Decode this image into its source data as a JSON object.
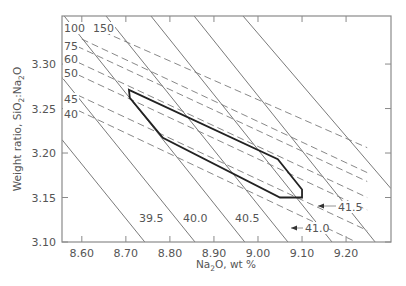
{
  "chart_data": {
    "type": "line",
    "title": "",
    "xlabel": "Na2O, wt %",
    "ylabel": "Weight ratio, SiO2:Na2O",
    "xlim": [
      8.555,
      9.302
    ],
    "ylim": [
      3.1,
      3.354
    ],
    "x_ticks": [
      "8.60",
      "8.70",
      "8.80",
      "8.90",
      "9.00",
      "9.10",
      "9.20"
    ],
    "y_ticks": [
      "3.10",
      "3.15",
      "3.20",
      "3.25",
      "3.30"
    ],
    "grid": false,
    "solid_isolines": [
      {
        "label": "39.5",
        "points": [
          [
            8.555,
            3.215
          ],
          [
            8.743,
            3.1
          ]
        ]
      },
      {
        "label": "40.0",
        "points": [
          [
            8.555,
            3.285
          ],
          [
            8.857,
            3.1
          ]
        ]
      },
      {
        "label": "40.5",
        "points": [
          [
            8.56,
            3.354
          ],
          [
            8.97,
            3.1
          ]
        ]
      },
      {
        "label": "41.0",
        "points": [
          [
            8.655,
            3.354
          ],
          [
            9.068,
            3.1
          ]
        ]
      },
      {
        "label": "41.5",
        "points": [
          [
            8.757,
            3.354
          ],
          [
            9.168,
            3.1
          ]
        ]
      },
      {
        "label": "",
        "points": [
          [
            8.855,
            3.354
          ],
          [
            9.266,
            3.1
          ]
        ]
      },
      {
        "label": "",
        "points": [
          [
            8.966,
            3.354
          ],
          [
            9.302,
            3.16
          ]
        ]
      }
    ],
    "dashed_isolines": [
      {
        "label": "150",
        "points": [
          [
            8.627,
            3.341
          ],
          [
            9.248,
            3.206
          ]
        ]
      },
      {
        "label": "100",
        "points": [
          [
            8.6,
            3.328
          ],
          [
            9.248,
            3.178
          ]
        ]
      },
      {
        "label": "75",
        "points": [
          [
            8.589,
            3.32
          ],
          [
            9.248,
            3.168
          ]
        ]
      },
      {
        "label": "60",
        "points": [
          [
            8.591,
            3.302
          ],
          [
            9.248,
            3.15
          ]
        ]
      },
      {
        "label": "50",
        "points": [
          [
            8.591,
            3.288
          ],
          [
            9.248,
            3.136
          ]
        ]
      },
      {
        "label": "45",
        "points": [
          [
            8.591,
            3.265
          ],
          [
            9.248,
            3.113
          ]
        ]
      },
      {
        "label": "40",
        "points": [
          [
            8.591,
            3.248
          ],
          [
            9.223,
            3.1
          ]
        ]
      }
    ],
    "region_polygon": [
      [
        8.707,
        3.271
      ],
      [
        9.045,
        3.193
      ],
      [
        9.1,
        3.159
      ],
      [
        9.1,
        3.15
      ],
      [
        9.05,
        3.15
      ],
      [
        8.784,
        3.217
      ],
      [
        8.709,
        3.262
      ]
    ]
  },
  "axes": {
    "x_title_main": "Na",
    "x_title_sub": "2",
    "x_title_rest": "O, wt %",
    "y_title_main": "Weight ratio, SiO",
    "y_title_sub1": "2",
    "y_title_mid": ":Na",
    "y_title_sub2": "2",
    "y_title_rest": "O"
  },
  "labels": {
    "solid": [
      {
        "text": "39.5",
        "x": 139,
        "y": 222
      },
      {
        "text": "40.0",
        "x": 183,
        "y": 222
      },
      {
        "text": "40.5",
        "x": 235,
        "y": 222
      },
      {
        "text": "41.0",
        "x": 305,
        "y": 232,
        "arrow_to": [
          291,
          228
        ]
      },
      {
        "text": "41.5",
        "x": 338,
        "y": 211,
        "arrow_to": [
          318,
          206
        ]
      }
    ],
    "dashed": [
      {
        "text": "100",
        "x": 64,
        "y": 32
      },
      {
        "text": "150",
        "x": 93,
        "y": 32
      },
      {
        "text": "75",
        "x": 64,
        "y": 50
      },
      {
        "text": "60",
        "x": 64,
        "y": 63
      },
      {
        "text": "50",
        "x": 64,
        "y": 77
      },
      {
        "text": "45",
        "x": 64,
        "y": 103
      },
      {
        "text": "40",
        "x": 64,
        "y": 118
      }
    ]
  },
  "colors": {
    "axis": "#8a8a8a",
    "line": "#7a7a7a",
    "dashed": "#7a7a7a",
    "region": "#222222",
    "text": "#555555"
  }
}
